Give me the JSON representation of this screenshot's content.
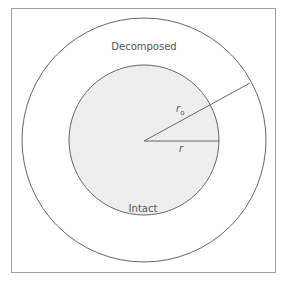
{
  "diagram": {
    "regions": {
      "outer_label": "Decomposed",
      "inner_label": "Intact"
    },
    "radii": {
      "outer_radius_label": "r",
      "outer_radius_subscript": "o",
      "inner_radius_label": "r"
    },
    "colors": {
      "frame": "#9a9a9a",
      "circle_stroke": "#666666",
      "inner_fill": "#eeeeee",
      "background": "#ffffff",
      "text": "#555555"
    }
  }
}
